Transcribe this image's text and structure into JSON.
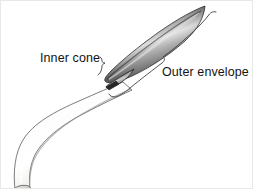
{
  "figure": {
    "background_color": "#ffffff",
    "border_color": "#e8e8e8"
  },
  "labels": {
    "inner_cone": "Inner cone",
    "outer_envelope": "Outer envelope"
  },
  "diagram": {
    "parts": [
      {
        "name": "burner-tube",
        "description": "curved light gray nozzle tube",
        "fill_light": "#f2f2f0",
        "fill_mid": "#d8d8d5",
        "stroke": "#6e6e6e"
      },
      {
        "name": "outer-envelope-flame",
        "description": "elongated dark lens-shaped outer flame envelope",
        "fill_dark": "#3a3a3a",
        "fill_mid": "#8f8f8f",
        "fill_light": "#dcdcdc",
        "stroke": "#2b2b2b"
      },
      {
        "name": "inner-cone-flame",
        "description": "small slender inner cone at flame base",
        "fill_dark": "#2e2e2e",
        "fill_light": "#b4b4b4",
        "stroke": "#1f1f1f"
      }
    ],
    "leaders": [
      {
        "name": "inner-cone-brace",
        "target": "inner cone",
        "stroke": "#3d3d3d"
      },
      {
        "name": "outer-envelope-brace",
        "target": "outer envelope",
        "stroke": "#3d3d3d"
      }
    ]
  }
}
